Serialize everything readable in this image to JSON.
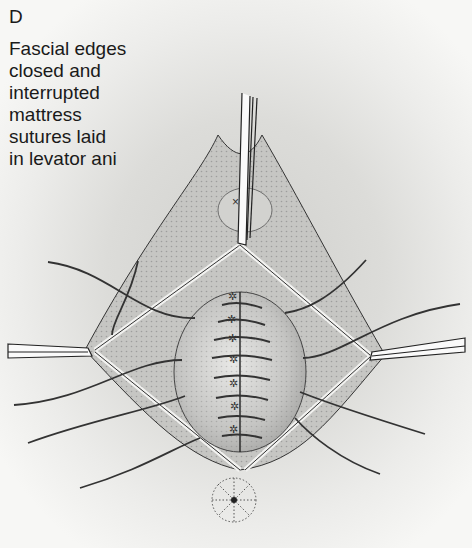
{
  "figure": {
    "panel_label": "D",
    "caption": "Fascial edges closed and interrupted mattress sutures laid in levator ani",
    "caption_lines": [
      "Fascial edges",
      "closed and",
      "interrupted",
      "mattress",
      "sutures laid",
      "in levator ani"
    ]
  },
  "illustration": {
    "subject": "surgical-repair-diagram",
    "elements": [
      "retractor-top",
      "retractor-left",
      "retractor-right",
      "fascia-closure",
      "interrupted-sutures",
      "mattress-sutures",
      "anus"
    ]
  }
}
